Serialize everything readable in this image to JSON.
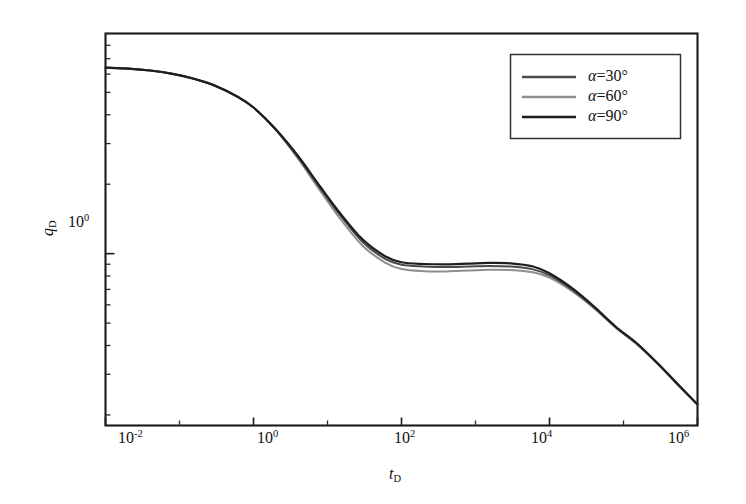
{
  "chart_data": {
    "type": "line",
    "title": "",
    "xlabel": "t_D",
    "ylabel": "q_D",
    "xscale": "log",
    "yscale": "log",
    "xlim": [
      0.01,
      1000000
    ],
    "ylim": [
      0.18,
      9.0
    ],
    "grid": false,
    "legend_position": "top-right",
    "x_tick_labels": [
      "10",
      "10",
      "10",
      "10",
      "10"
    ],
    "x_tick_exponents": [
      "-2",
      "0",
      "2",
      "4",
      "6"
    ],
    "x_tick_values": [
      0.01,
      1,
      100,
      10000,
      1000000
    ],
    "y_tick_labels": [
      "10"
    ],
    "y_tick_exponents": [
      "0"
    ],
    "y_tick_values": [
      1
    ],
    "series": [
      {
        "name": "alpha=30deg",
        "label_alpha": "α",
        "label_rest": "=30",
        "label_deg": "°",
        "color": "#4a4a4a",
        "width": 2.0,
        "points": [
          [
            0.01,
            6.4
          ],
          [
            0.02,
            6.34
          ],
          [
            0.04,
            6.22
          ],
          [
            0.08,
            6.02
          ],
          [
            0.15,
            5.75
          ],
          [
            0.3,
            5.35
          ],
          [
            0.6,
            4.8
          ],
          [
            1.0,
            4.3
          ],
          [
            2.0,
            3.45
          ],
          [
            4.0,
            2.62
          ],
          [
            8.0,
            1.92
          ],
          [
            15,
            1.46
          ],
          [
            30,
            1.12
          ],
          [
            60,
            0.95
          ],
          [
            100,
            0.895
          ],
          [
            200,
            0.88
          ],
          [
            400,
            0.875
          ],
          [
            800,
            0.88
          ],
          [
            1500,
            0.885
          ],
          [
            3000,
            0.88
          ],
          [
            6000,
            0.855
          ],
          [
            10000,
            0.805
          ],
          [
            20000,
            0.7
          ],
          [
            40000,
            0.585
          ],
          [
            80000,
            0.478
          ],
          [
            150000,
            0.408
          ],
          [
            300000,
            0.33
          ],
          [
            600000,
            0.262
          ],
          [
            1000000,
            0.222
          ]
        ]
      },
      {
        "name": "alpha=60deg",
        "label_alpha": "α",
        "label_rest": "=60",
        "label_deg": "°",
        "color": "#8e8e8e",
        "width": 2.0,
        "points": [
          [
            0.01,
            6.4
          ],
          [
            0.02,
            6.34
          ],
          [
            0.04,
            6.22
          ],
          [
            0.08,
            6.02
          ],
          [
            0.15,
            5.75
          ],
          [
            0.3,
            5.35
          ],
          [
            0.6,
            4.8
          ],
          [
            1.0,
            4.3
          ],
          [
            2.0,
            3.44
          ],
          [
            4.0,
            2.58
          ],
          [
            8.0,
            1.87
          ],
          [
            15,
            1.41
          ],
          [
            30,
            1.08
          ],
          [
            60,
            0.915
          ],
          [
            100,
            0.858
          ],
          [
            200,
            0.84
          ],
          [
            400,
            0.838
          ],
          [
            800,
            0.845
          ],
          [
            1500,
            0.852
          ],
          [
            3000,
            0.85
          ],
          [
            6000,
            0.83
          ],
          [
            10000,
            0.788
          ],
          [
            20000,
            0.69
          ],
          [
            40000,
            0.58
          ],
          [
            80000,
            0.475
          ],
          [
            150000,
            0.406
          ],
          [
            300000,
            0.329
          ],
          [
            600000,
            0.261
          ],
          [
            1000000,
            0.222
          ]
        ]
      },
      {
        "name": "alpha=90deg",
        "label_alpha": "α",
        "label_rest": "=90",
        "label_deg": "°",
        "color": "#1e1e1e",
        "width": 2.2,
        "points": [
          [
            0.01,
            6.4
          ],
          [
            0.02,
            6.34
          ],
          [
            0.04,
            6.22
          ],
          [
            0.08,
            6.02
          ],
          [
            0.15,
            5.75
          ],
          [
            0.3,
            5.35
          ],
          [
            0.6,
            4.8
          ],
          [
            1.0,
            4.3
          ],
          [
            2.0,
            3.46
          ],
          [
            4.0,
            2.65
          ],
          [
            8.0,
            1.95
          ],
          [
            15,
            1.49
          ],
          [
            30,
            1.15
          ],
          [
            60,
            0.975
          ],
          [
            100,
            0.918
          ],
          [
            200,
            0.902
          ],
          [
            400,
            0.898
          ],
          [
            800,
            0.905
          ],
          [
            1500,
            0.912
          ],
          [
            3000,
            0.908
          ],
          [
            6000,
            0.88
          ],
          [
            10000,
            0.822
          ],
          [
            20000,
            0.71
          ],
          [
            40000,
            0.59
          ],
          [
            80000,
            0.48
          ],
          [
            150000,
            0.41
          ],
          [
            300000,
            0.331
          ],
          [
            600000,
            0.263
          ],
          [
            1000000,
            0.222
          ]
        ]
      }
    ]
  },
  "axes": {
    "x_title_var": "t",
    "x_title_sub": "D",
    "y_title_var": "q",
    "y_title_sub": "D"
  },
  "legend": {
    "entries": [
      {
        "alpha": "α",
        "eq": "=30",
        "deg": "°"
      },
      {
        "alpha": "α",
        "eq": "=60",
        "deg": "°"
      },
      {
        "alpha": "α",
        "eq": "=90",
        "deg": "°"
      }
    ]
  },
  "colors": {
    "axis": "#1a1a1a",
    "background": "#ffffff",
    "series_30": "#4a4a4a",
    "series_60": "#8e8e8e",
    "series_90": "#1e1e1e"
  }
}
